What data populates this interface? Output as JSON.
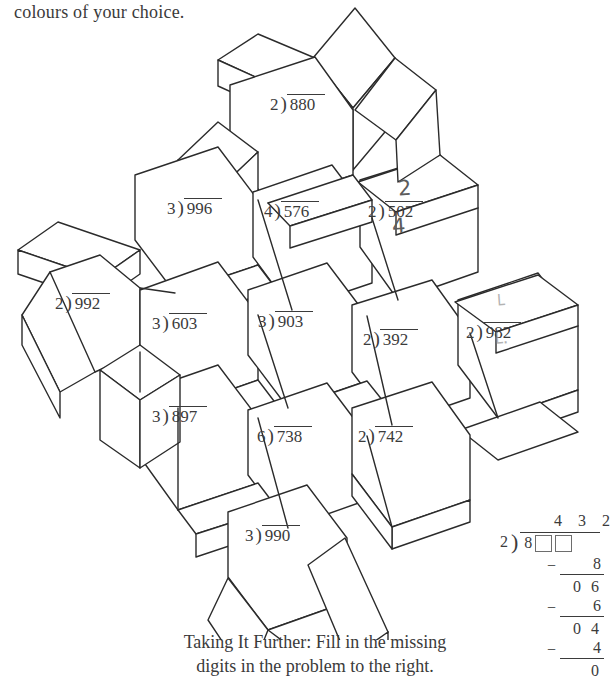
{
  "instruction": "colours of your choice.",
  "figure": {
    "icon": "isometric-blocks-puzzle",
    "stroke_color": "#2b2b2b",
    "fill_color": "#ffffff"
  },
  "problems": [
    {
      "id": "p880",
      "divisor": "2",
      "bracket": ")",
      "dividend": "880",
      "x": 270,
      "y": 94
    },
    {
      "id": "p996",
      "divisor": "3",
      "bracket": ")",
      "dividend": "996",
      "x": 167,
      "y": 198
    },
    {
      "id": "p576",
      "divisor": "4",
      "bracket": ")",
      "dividend": "576",
      "x": 264,
      "y": 201
    },
    {
      "id": "p502",
      "divisor": "2",
      "bracket": ")",
      "dividend": "502",
      "x": 368,
      "y": 201
    },
    {
      "id": "p992",
      "divisor": "2",
      "bracket": ")",
      "dividend": "992",
      "x": 55,
      "y": 293
    },
    {
      "id": "p603",
      "divisor": "3",
      "bracket": ")",
      "dividend": "603",
      "x": 152,
      "y": 313
    },
    {
      "id": "p903",
      "divisor": "3",
      "bracket": ")",
      "dividend": "903",
      "x": 258,
      "y": 311
    },
    {
      "id": "p392",
      "divisor": "2",
      "bracket": ")",
      "dividend": "392",
      "x": 363,
      "y": 329
    },
    {
      "id": "p982",
      "divisor": "2",
      "bracket": ")",
      "dividend": "982",
      "x": 466,
      "y": 322
    },
    {
      "id": "p897",
      "divisor": "3",
      "bracket": ")",
      "dividend": "897",
      "x": 152,
      "y": 406
    },
    {
      "id": "p738",
      "divisor": "6",
      "bracket": ")",
      "dividend": "738",
      "x": 257,
      "y": 426
    },
    {
      "id": "p742",
      "divisor": "2",
      "bracket": ")",
      "dividend": "742",
      "x": 358,
      "y": 426
    },
    {
      "id": "p990",
      "divisor": "3",
      "bracket": ")",
      "dividend": "990",
      "x": 245,
      "y": 525
    }
  ],
  "pencil_marks": [
    {
      "id": "mark-502-quotient",
      "text": "2",
      "x": 398,
      "y": 178,
      "faint": false
    },
    {
      "id": "mark-502-work",
      "text": "4",
      "x": 392,
      "y": 216,
      "faint": false
    },
    {
      "id": "mark-982-above",
      "text": "└",
      "x": 494,
      "y": 296,
      "faint": true
    },
    {
      "id": "mark-982-below",
      "text": "└·",
      "x": 492,
      "y": 334,
      "faint": true
    }
  ],
  "taking_further": {
    "line1": "Taking It Further: Fill in the missing",
    "line2": "digits in the problem to the right."
  },
  "long_division": {
    "quotient": "4 3 2",
    "divisor": "2",
    "bracket": ")",
    "dividend_first_digit": "8",
    "blank_boxes": 2,
    "steps": [
      {
        "id": "step-1",
        "minus": "−",
        "value": "8",
        "underlined": true
      },
      {
        "id": "step-2",
        "minus": "",
        "value": "0 6",
        "underlined": false
      },
      {
        "id": "step-3",
        "minus": "−",
        "value": "6",
        "underlined": true
      },
      {
        "id": "step-4",
        "minus": "",
        "value": "0 4",
        "underlined": false
      },
      {
        "id": "step-5",
        "minus": "−",
        "value": "4",
        "underlined": true
      },
      {
        "id": "step-6",
        "minus": "",
        "value": "0",
        "underlined": false
      }
    ]
  }
}
